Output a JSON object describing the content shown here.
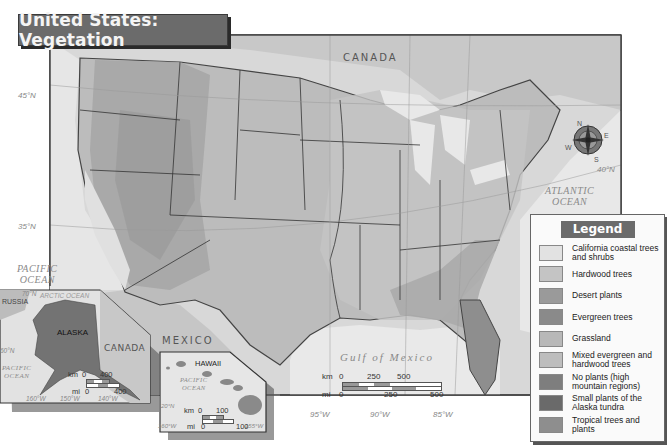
{
  "title": "United States: Vegetation",
  "labels": {
    "canada": "CANADA",
    "mexico": "MEXICO",
    "atlantic_ocean": [
      "ATLANTIC",
      "OCEAN"
    ],
    "pacific_ocean": [
      "PACIFIC",
      "OCEAN"
    ],
    "gulf_of_mexico": "Gulf of Mexico"
  },
  "coordinates": {
    "lat_45": "45°N",
    "lat_35": "35°N",
    "lat_40": "40°N",
    "lon_95": "95°W",
    "lon_90": "90°W",
    "lon_85": "85°W"
  },
  "compass": {
    "n": "N",
    "e": "E",
    "s": "S",
    "w": "W"
  },
  "main_scale": {
    "km_label": "km",
    "mi_label": "mi",
    "km_ticks": [
      "0",
      "250",
      "500"
    ],
    "mi_ticks": [
      "0",
      "250",
      "500"
    ]
  },
  "alaska_inset": {
    "title": "ALASKA",
    "russia": "RUSSIA",
    "canada": "CANADA",
    "arctic_ocean": "ARCTIC OCEAN",
    "pacific_ocean": [
      "PACIFIC",
      "OCEAN"
    ],
    "lat_70": "70°N",
    "lat_60": "60°N",
    "lon_160": "160°W",
    "lon_150": "150°W",
    "lon_140": "140°W",
    "scale": {
      "km_label": "km",
      "mi_label": "mi",
      "km_ticks": [
        "0",
        "400"
      ],
      "mi_ticks": [
        "0",
        "400"
      ]
    }
  },
  "hawaii_inset": {
    "title": "HAWAII",
    "pacific_ocean": [
      "PACIFIC",
      "OCEAN"
    ],
    "lat_20": "20°N",
    "lon_160": "160°W",
    "lon_155": "155°W",
    "scale": {
      "km_label": "km",
      "mi_label": "mi",
      "km_ticks": [
        "0",
        "100"
      ],
      "mi_ticks": [
        "0",
        "100"
      ]
    }
  },
  "legend": {
    "title": "Legend",
    "items": [
      {
        "label": "California coastal trees and shrubs",
        "color": "#e2e2e2"
      },
      {
        "label": "Hardwood trees",
        "color": "#c4c4c4"
      },
      {
        "label": "Desert plants",
        "color": "#9a9a9a"
      },
      {
        "label": "Evergreen trees",
        "color": "#8a8a8a"
      },
      {
        "label": "Grassland",
        "color": "#b8b8b8"
      },
      {
        "label": "Mixed evergreen and hardwood trees",
        "color": "#bdbdbd"
      },
      {
        "label": "No plants (high mountain regions)",
        "color": "#7e7e7e"
      },
      {
        "label": "Small plants of the Alaska tundra",
        "color": "#6a6a6a"
      },
      {
        "label": "Tropical trees and plants",
        "color": "#8e8e8e"
      }
    ]
  }
}
